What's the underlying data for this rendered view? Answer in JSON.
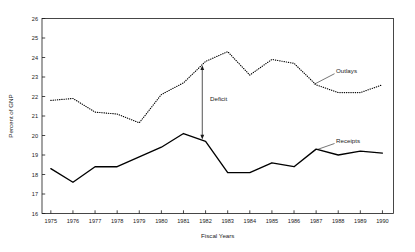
{
  "chart_data": {
    "type": "line",
    "title": "",
    "xlabel": "Fiscal Years",
    "ylabel": "Percent of GNP",
    "x": [
      1975,
      1976,
      1977,
      1978,
      1979,
      1980,
      1981,
      1982,
      1983,
      1984,
      1985,
      1986,
      1987,
      1988,
      1989,
      1990
    ],
    "xtick_labels": [
      "1975",
      "1976",
      "1977",
      "1978",
      "1979",
      "1980",
      "1981",
      "1982",
      "1983",
      "1984",
      "1985",
      "1986",
      "1987",
      "1988",
      "1989",
      "1990"
    ],
    "ytick_labels": [
      "16",
      "17",
      "18",
      "19",
      "20",
      "21",
      "22",
      "23",
      "24",
      "25",
      "26"
    ],
    "ytick_values": [
      16,
      17,
      18,
      19,
      20,
      21,
      22,
      23,
      24,
      25,
      26
    ],
    "xlim": [
      1974.6,
      1990.5
    ],
    "ylim": [
      16,
      26
    ],
    "grid": false,
    "legend_position": "inline-annotation",
    "series": [
      {
        "name": "Outlays",
        "style": "dotted",
        "color": "#000000",
        "values": [
          21.8,
          21.9,
          21.2,
          21.1,
          20.65,
          22.1,
          22.7,
          23.8,
          24.3,
          23.1,
          23.9,
          23.7,
          22.6,
          22.2,
          22.2,
          22.6
        ]
      },
      {
        "name": "Receipts",
        "style": "solid",
        "color": "#000000",
        "values": [
          18.3,
          17.6,
          18.4,
          18.4,
          18.9,
          19.4,
          20.1,
          19.7,
          18.1,
          18.1,
          18.6,
          18.4,
          19.3,
          19.0,
          19.2,
          19.1
        ]
      }
    ],
    "annotations": [
      {
        "name": "deficit-arrow",
        "label": "Deficit",
        "x": 1981.85,
        "y_top": 23.6,
        "y_bottom": 19.8,
        "arrow": "double-headed",
        "label_x": 1982.2,
        "label_y": 21.75
      }
    ],
    "series_callouts": [
      {
        "name": "Outlays",
        "label_x": 1987.9,
        "label_y": 23.2,
        "leader_to_x": 1986.9,
        "leader_to_y": 22.62
      },
      {
        "name": "Receipts",
        "label_x": 1987.9,
        "label_y": 19.62,
        "leader_to_x": 1987.05,
        "leader_to_y": 19.28
      }
    ]
  }
}
